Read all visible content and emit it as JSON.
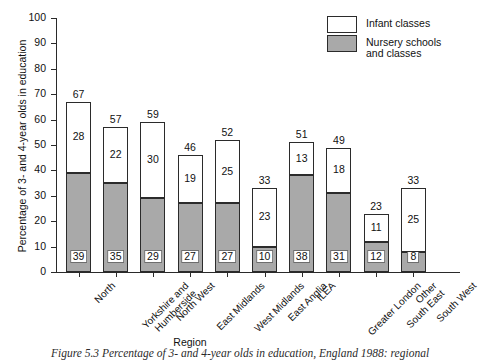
{
  "chart_data": {
    "type": "bar",
    "subtype": "stacked-bar",
    "title": "",
    "xlabel": "Region",
    "ylabel": "Percentage of 3- and 4-year olds in education",
    "ylim": [
      0,
      100
    ],
    "yticks": [
      0,
      10,
      20,
      30,
      40,
      50,
      60,
      70,
      80,
      90,
      100
    ],
    "grid": false,
    "legend_position": "top-right",
    "categories": [
      "North",
      "Yorkshire and\nHumberside",
      "North West",
      "East Midlands",
      "West Midlands",
      "East Anglia",
      "ILEA",
      "Greater London",
      "Other\nSouth East",
      "South West"
    ],
    "series": [
      {
        "name": "Nursery schools\nand classes",
        "color": "#a9a9a9",
        "values": [
          39,
          35,
          29,
          27,
          27,
          10,
          38,
          31,
          12,
          8
        ]
      },
      {
        "name": "Infant classes",
        "color": "#ffffff",
        "values": [
          28,
          22,
          30,
          19,
          25,
          23,
          13,
          18,
          11,
          25
        ]
      }
    ],
    "totals": [
      67,
      57,
      59,
      46,
      52,
      33,
      51,
      49,
      23,
      33
    ]
  },
  "legend": {
    "items": [
      {
        "label": "Infant classes",
        "swatch": "infant"
      },
      {
        "label": "Nursery schools\nand classes",
        "swatch": "nursery"
      }
    ]
  },
  "caption": {
    "text": "Figure 5.3   Percentage of 3- and 4-year olds in education, England 1988: regional"
  }
}
